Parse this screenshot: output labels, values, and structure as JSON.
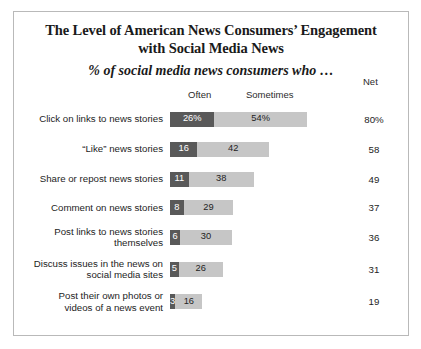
{
  "title": {
    "line1": "The Level of American News Consumers’ Engagement",
    "line2": "with Social Media News",
    "subtitle": "% of social media news consumers who …"
  },
  "headers": {
    "often": "Often",
    "sometimes": "Sometimes",
    "net": "Net"
  },
  "colors": {
    "often": "#595959",
    "sometimes": "#c6c6c6",
    "frame": "#b9b9b9",
    "text": "#1d1d1d"
  },
  "chart_data": {
    "type": "bar",
    "title": "The Level of American News Consumers’ Engagement with Social Media News",
    "subtitle": "% of social media news consumers who …",
    "xlabel": "",
    "ylabel": "",
    "stacked": true,
    "orientation": "horizontal",
    "grid": false,
    "legend_position": "top",
    "xlim": [
      0,
      80
    ],
    "categories": [
      "Click on links to news stories",
      "“Like” news stories",
      "Share or repost news stories",
      "Comment on news stories",
      "Post links to news stories\nthemselves",
      "Discuss issues in the news on\nsocial media sites",
      "Post their own photos or\nvideos of a news event"
    ],
    "series": [
      {
        "name": "Often",
        "values": [
          26,
          16,
          11,
          8,
          6,
          5,
          3
        ]
      },
      {
        "name": "Sometimes",
        "values": [
          54,
          42,
          38,
          29,
          30,
          26,
          16
        ]
      }
    ],
    "net": {
      "name": "Net",
      "values": [
        80,
        58,
        49,
        37,
        36,
        31,
        19
      ]
    }
  },
  "rows": [
    {
      "label": "Click on links to news stories",
      "often": 26,
      "sometimes": 54,
      "net": 80,
      "often_label": "26%",
      "sometimes_label": "54%",
      "net_label": "80%"
    },
    {
      "label": "“Like” news stories",
      "often": 16,
      "sometimes": 42,
      "net": 58,
      "often_label": "16",
      "sometimes_label": "42",
      "net_label": "58"
    },
    {
      "label": "Share or repost news stories",
      "often": 11,
      "sometimes": 38,
      "net": 49,
      "often_label": "11",
      "sometimes_label": "38",
      "net_label": "49"
    },
    {
      "label": "Comment on news stories",
      "often": 8,
      "sometimes": 29,
      "net": 37,
      "often_label": "8",
      "sometimes_label": "29",
      "net_label": "37"
    },
    {
      "label": "Post links to news stories\nthemselves",
      "often": 6,
      "sometimes": 30,
      "net": 36,
      "often_label": "6",
      "sometimes_label": "30",
      "net_label": "36"
    },
    {
      "label": "Discuss issues in the news on\nsocial media sites",
      "often": 5,
      "sometimes": 26,
      "net": 31,
      "often_label": "5",
      "sometimes_label": "26",
      "net_label": "31"
    },
    {
      "label": "Post their own photos or\nvideos of a news event",
      "often": 3,
      "sometimes": 16,
      "net": 19,
      "often_label": "3",
      "sometimes_label": "16",
      "net_label": "19"
    }
  ]
}
